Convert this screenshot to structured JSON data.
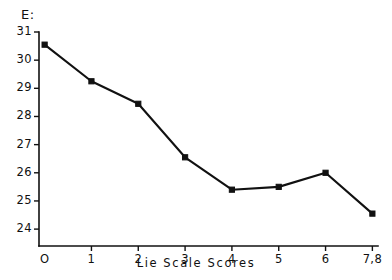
{
  "chart_data": {
    "type": "line",
    "title": "",
    "subtitle": "",
    "xlabel": "Lie  Scale  Scores",
    "ylabel": "E:",
    "categories": [
      "O",
      "1",
      "2",
      "3",
      "4",
      "5",
      "6",
      "7,8"
    ],
    "x": [
      0,
      1,
      2,
      3,
      4,
      5,
      6,
      7
    ],
    "values": [
      30.55,
      29.25,
      28.45,
      26.55,
      25.4,
      25.5,
      26.0,
      24.55
    ],
    "yticks": [
      31,
      30,
      29,
      28,
      27,
      26,
      25,
      24
    ],
    "ytick_labels": [
      "31",
      "30",
      "29",
      "28",
      "27",
      "26",
      "25",
      "24"
    ],
    "ylim": [
      23.4,
      31.0
    ],
    "xlim": [
      -0.12,
      7.12
    ],
    "grid": false,
    "legend": null,
    "marker": "filled-square",
    "line_color": "#111111",
    "marker_color": "#111111",
    "background_color": "#ffffff"
  },
  "axes": {
    "y_axis_title": "E:",
    "x_axis_title": "Lie  Scale  Scores"
  }
}
